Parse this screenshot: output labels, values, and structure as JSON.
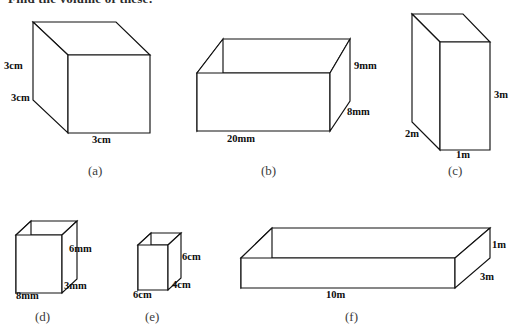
{
  "page": {
    "background_color": "#ffffff",
    "ink_color": "#111111",
    "prompt": "Find the volume of these:"
  },
  "figures": [
    {
      "id": "a",
      "caption": "(a)",
      "shape": "cube",
      "dimensions": [
        {
          "name": "height",
          "text": "3cm"
        },
        {
          "name": "depth",
          "text": "3cm"
        },
        {
          "name": "width",
          "text": "3cm"
        }
      ]
    },
    {
      "id": "b",
      "caption": "(b)",
      "shape": "cuboid",
      "dimensions": [
        {
          "name": "height",
          "text": "9mm"
        },
        {
          "name": "depth",
          "text": "8mm"
        },
        {
          "name": "width",
          "text": "20mm"
        }
      ]
    },
    {
      "id": "c",
      "caption": "(c)",
      "shape": "cuboid",
      "dimensions": [
        {
          "name": "height",
          "text": "3m"
        },
        {
          "name": "depth",
          "text": "2m"
        },
        {
          "name": "width",
          "text": "1m"
        }
      ]
    },
    {
      "id": "d",
      "caption": "(d)",
      "shape": "cuboid",
      "dimensions": [
        {
          "name": "height",
          "text": "6mm"
        },
        {
          "name": "depth",
          "text": "3mm"
        },
        {
          "name": "width",
          "text": "8mm"
        }
      ]
    },
    {
      "id": "e",
      "caption": "(e)",
      "shape": "cuboid",
      "dimensions": [
        {
          "name": "height",
          "text": "6cm"
        },
        {
          "name": "depth",
          "text": "4cm"
        },
        {
          "name": "width",
          "text": "6cm"
        }
      ]
    },
    {
      "id": "f",
      "caption": "(f)",
      "shape": "cuboid",
      "dimensions": [
        {
          "name": "height",
          "text": "1m"
        },
        {
          "name": "depth",
          "text": "3m"
        },
        {
          "name": "width",
          "text": "10m"
        }
      ]
    }
  ]
}
